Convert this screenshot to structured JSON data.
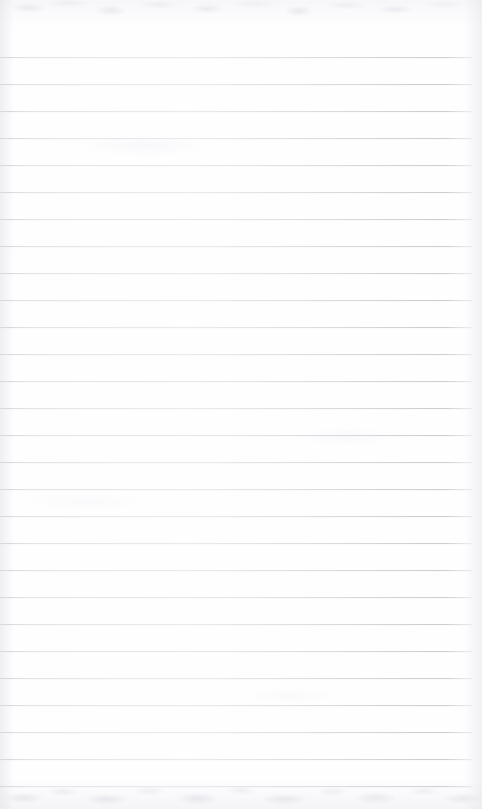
{
  "document": {
    "kind": "lined-notebook-page",
    "title": "Blank ruled notepad page",
    "page_text": "",
    "written_content": [],
    "has_handwriting": false,
    "has_printed_text": false
  },
  "page": {
    "width": 482,
    "height": 809,
    "background_color": "#fefeff",
    "paper_tone": "#ffffff"
  },
  "ruling": {
    "style": "horizontal-ruled",
    "line_color": "#dcdce1",
    "line_color_dark_edge": "#cbcbd2",
    "line_thickness_px": 1,
    "line_spacing_px": 27,
    "first_line_y": 57,
    "last_line_y": 786,
    "line_count": 28,
    "line_left_x": 0,
    "line_right_x": 472,
    "line_length_px": 472,
    "margin_top_px": 57,
    "margin_bottom_px": 23,
    "margin_right_px": 10,
    "has_vertical_margin_rule": false
  },
  "texture": {
    "top_band_height_px": 26,
    "bottom_band_height_px": 29,
    "smudge_color": "#e3e3e9",
    "edge_shade_color": "#e2e2e6",
    "description": "faint mottled scanner texture along the top and bottom margins with soft vertical edge shading"
  },
  "lines": [
    {
      "index": 1,
      "y": 57
    },
    {
      "index": 2,
      "y": 84
    },
    {
      "index": 3,
      "y": 111
    },
    {
      "index": 4,
      "y": 138
    },
    {
      "index": 5,
      "y": 165
    },
    {
      "index": 6,
      "y": 192
    },
    {
      "index": 7,
      "y": 219
    },
    {
      "index": 8,
      "y": 246
    },
    {
      "index": 9,
      "y": 273
    },
    {
      "index": 10,
      "y": 300
    },
    {
      "index": 11,
      "y": 327
    },
    {
      "index": 12,
      "y": 354
    },
    {
      "index": 13,
      "y": 381
    },
    {
      "index": 14,
      "y": 408
    },
    {
      "index": 15,
      "y": 435
    },
    {
      "index": 16,
      "y": 462
    },
    {
      "index": 17,
      "y": 489
    },
    {
      "index": 18,
      "y": 516
    },
    {
      "index": 19,
      "y": 543
    },
    {
      "index": 20,
      "y": 570
    },
    {
      "index": 21,
      "y": 597
    },
    {
      "index": 22,
      "y": 624
    },
    {
      "index": 23,
      "y": 651
    },
    {
      "index": 24,
      "y": 678
    },
    {
      "index": 25,
      "y": 705
    },
    {
      "index": 26,
      "y": 732
    },
    {
      "index": 27,
      "y": 759
    },
    {
      "index": 28,
      "y": 786
    }
  ]
}
